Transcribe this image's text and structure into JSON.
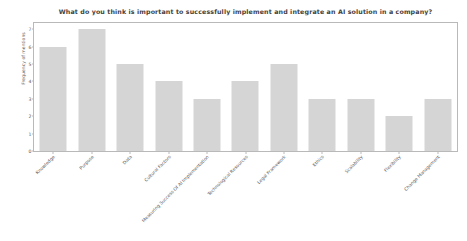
{
  "chart_data": {
    "type": "bar",
    "title": "What do you think is important to successfully implement and integrate an AI solution in a company?",
    "xlabel": "",
    "ylabel": "Frequency of mentions",
    "categories": [
      "Knowledge",
      "Purpose",
      "Data",
      "Cultural Factors",
      "Measuring Success Of AI Implementation",
      "Technological Resources",
      "Legal Framework",
      "Ethics",
      "Scalability",
      "Flexibility",
      "Change Management"
    ],
    "values": [
      6,
      7,
      5,
      4,
      3,
      4,
      5,
      3,
      3,
      2,
      3
    ],
    "ylim": [
      0,
      7.35
    ],
    "yticks": [
      "0",
      "1",
      "2",
      "3",
      "4",
      "5",
      "6",
      "7"
    ],
    "ytick_values": [
      0,
      1,
      2,
      3,
      4,
      5,
      6,
      7
    ],
    "grid": false,
    "legend": false,
    "bar_color": "#d5d5d5",
    "axis_color": "#b9b9b9",
    "text_color": "#5a5a5a",
    "background": "#ffffff"
  }
}
